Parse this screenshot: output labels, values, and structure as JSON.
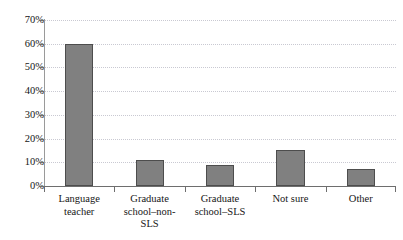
{
  "chart_data": {
    "type": "bar",
    "title": "",
    "subtitle": "",
    "xlabel": "",
    "ylabel": "",
    "categories": [
      "Language teacher",
      "Graduate school–non-SLS",
      "Graduate school–SLS",
      "Not sure",
      "Other"
    ],
    "values": [
      60,
      11,
      9,
      15,
      7
    ],
    "ylim": [
      0,
      70
    ],
    "ytick_values": [
      0,
      10,
      20,
      30,
      40,
      50,
      60,
      70
    ],
    "ytick_labels": [
      "0%",
      "10%",
      "20%",
      "30%",
      "40%",
      "50%",
      "60%",
      "70%"
    ],
    "grid": true,
    "grid_axis": "y",
    "grid_style": "dotted",
    "legend": false,
    "legend_position": "none",
    "bar_fill_color": "#808080",
    "bar_border_color": "#4d4d4d",
    "gridline_color": "#c9c9d2",
    "axis_color": "#6e6e6e",
    "text_color": "#161616",
    "background_color": "#ffffff"
  }
}
